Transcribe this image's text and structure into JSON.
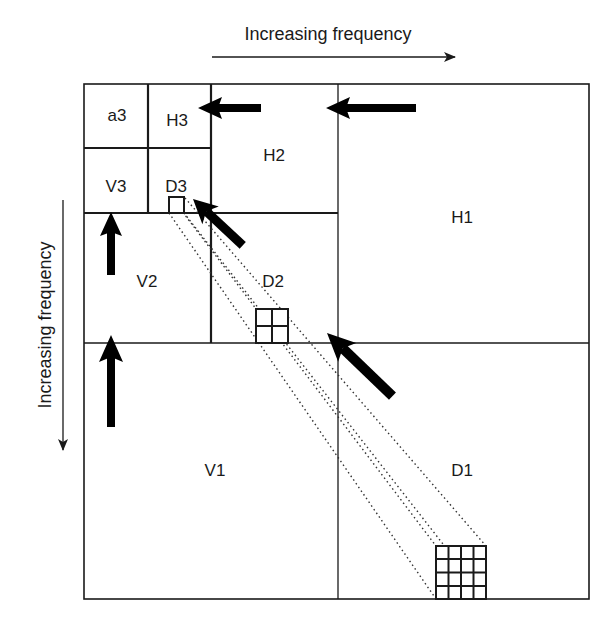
{
  "diagram": {
    "type": "wavelet-decomposition",
    "axes": {
      "horizontal_label": "Increasing frequency",
      "vertical_label": "Increasing frequency"
    },
    "subbands": {
      "a3": "a3",
      "H3": "H3",
      "V3": "V3",
      "D3": "D3",
      "H2": "H2",
      "V2": "V2",
      "D2": "D2",
      "H1": "H1",
      "V1": "V1",
      "D1": "D1"
    },
    "colors": {
      "line": "#1a1a1a",
      "background": "#ffffff"
    }
  }
}
